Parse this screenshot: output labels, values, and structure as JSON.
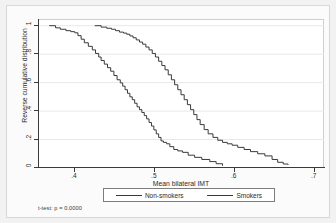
{
  "figure": {
    "background_color": "#f2f2f2",
    "plot_background_color": "#ffffff",
    "line_color": "#3a3a3a",
    "axis_color": "#3a3a3a",
    "grid_color": "#e8e8e8"
  },
  "axes": {
    "x_title": "Mean bilateral IMT",
    "y_title": "Reverse cumulative distribution",
    "x_ticks": [
      ".4",
      ".5",
      ".6",
      ".7"
    ],
    "y_ticks": [
      "0",
      ".2",
      ".4",
      ".6",
      ".8",
      "1"
    ]
  },
  "legend": {
    "entries": [
      {
        "label": "Non-smokers",
        "swatch": "line-swatch"
      },
      {
        "label": "Smokers",
        "swatch": "line-swatch"
      }
    ]
  },
  "note": {
    "text": "t-test: p = 0.0000"
  },
  "chart_data": {
    "type": "line",
    "title": "",
    "subtitle": "",
    "xlabel": "Mean bilateral IMT",
    "ylabel": "Reverse cumulative distribution",
    "xlim": [
      0.355,
      0.713
    ],
    "ylim": [
      0,
      1.04
    ],
    "xticks": [
      0.4,
      0.5,
      0.6,
      0.7
    ],
    "yticks": [
      0,
      0.2,
      0.4,
      0.6,
      0.8,
      1.0
    ],
    "grid": "horizontal",
    "legend_position": "below-plot",
    "annotations": [
      "t-test: p = 0.0000"
    ],
    "series": [
      {
        "name": "Non-smokers",
        "color": "#3a3a3a",
        "x": [
          0.369,
          0.377,
          0.383,
          0.39,
          0.396,
          0.401,
          0.405,
          0.409,
          0.413,
          0.418,
          0.423,
          0.427,
          0.431,
          0.434,
          0.438,
          0.442,
          0.446,
          0.45,
          0.454,
          0.458,
          0.461,
          0.464,
          0.467,
          0.47,
          0.473,
          0.476,
          0.479,
          0.482,
          0.485,
          0.488,
          0.491,
          0.494,
          0.497,
          0.5,
          0.503,
          0.506,
          0.509,
          0.512,
          0.516,
          0.52,
          0.525,
          0.53,
          0.536,
          0.543,
          0.551,
          0.56,
          0.57,
          0.578,
          0.586
        ],
        "y": [
          1.0,
          0.985,
          0.975,
          0.965,
          0.958,
          0.95,
          0.93,
          0.905,
          0.88,
          0.855,
          0.83,
          0.805,
          0.78,
          0.755,
          0.73,
          0.705,
          0.68,
          0.65,
          0.62,
          0.598,
          0.575,
          0.55,
          0.525,
          0.5,
          0.48,
          0.455,
          0.43,
          0.41,
          0.39,
          0.368,
          0.345,
          0.32,
          0.295,
          0.268,
          0.24,
          0.215,
          0.19,
          0.18,
          0.17,
          0.15,
          0.13,
          0.12,
          0.11,
          0.09,
          0.075,
          0.06,
          0.045,
          0.03,
          0.015
        ]
      },
      {
        "name": "Smokers",
        "color": "#3a3a3a",
        "x": [
          0.426,
          0.434,
          0.441,
          0.447,
          0.452,
          0.457,
          0.462,
          0.466,
          0.47,
          0.474,
          0.478,
          0.482,
          0.486,
          0.49,
          0.494,
          0.498,
          0.502,
          0.506,
          0.51,
          0.514,
          0.518,
          0.522,
          0.526,
          0.53,
          0.534,
          0.538,
          0.542,
          0.546,
          0.55,
          0.554,
          0.558,
          0.563,
          0.568,
          0.574,
          0.58,
          0.586,
          0.592,
          0.598,
          0.605,
          0.613,
          0.621,
          0.63,
          0.639,
          0.648,
          0.655,
          0.662,
          0.668
        ],
        "y": [
          1.0,
          0.99,
          0.982,
          0.975,
          0.965,
          0.955,
          0.948,
          0.94,
          0.928,
          0.915,
          0.9,
          0.885,
          0.87,
          0.85,
          0.83,
          0.805,
          0.78,
          0.75,
          0.72,
          0.69,
          0.655,
          0.62,
          0.585,
          0.55,
          0.515,
          0.48,
          0.445,
          0.41,
          0.375,
          0.34,
          0.305,
          0.27,
          0.24,
          0.215,
          0.195,
          0.18,
          0.17,
          0.16,
          0.145,
          0.13,
          0.115,
          0.1,
          0.085,
          0.06,
          0.04,
          0.028,
          0.022
        ]
      }
    ]
  }
}
